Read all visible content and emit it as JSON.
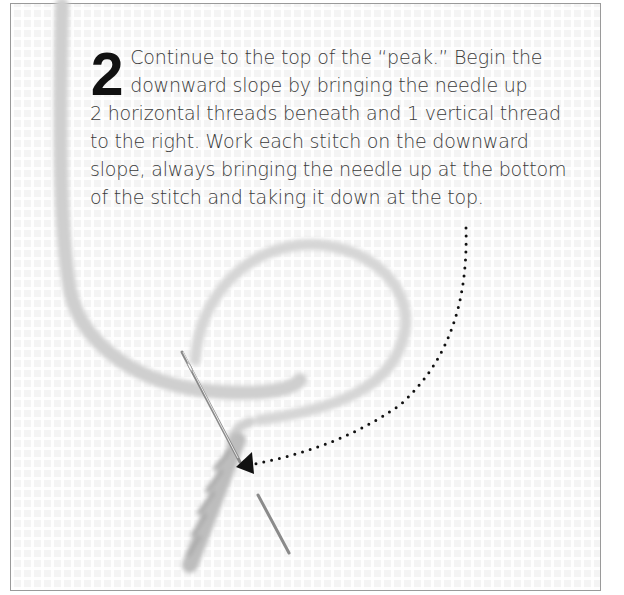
{
  "step": {
    "number": "2",
    "lines": [
      "Continue to the top of the “peak.” Begin the",
      "downward slope by bringing the needle up",
      "2 horizontal threads beneath and 1 vertical thread",
      "to the right. Work each stitch on the downward",
      "slope, always bringing the needle up at the bottom",
      "of the stitch and taking it down at the top."
    ]
  },
  "illustration": {
    "background": "plastic-canvas-mesh",
    "elements": [
      "yarn-loop",
      "needle",
      "worked-stitches",
      "dotted-arrow"
    ],
    "colors": {
      "text": "#3a3a3a",
      "number": "#111111",
      "frame_border": "#9a9a9a",
      "arrow": "#111111",
      "yarn": "#d8d8d8"
    }
  }
}
